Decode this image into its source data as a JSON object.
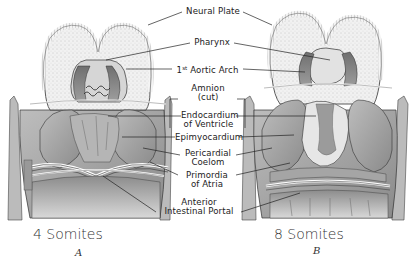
{
  "figure": {
    "labels": {
      "neural_plate": "Neural Plate",
      "pharynx": "Pharynx",
      "aortic_arch_num": "1",
      "aortic_arch_sup": "st",
      "aortic_arch_text": "Aortic Arch",
      "amnion_line1": "Amnion",
      "amnion_line2": "(cut)",
      "endocardium_line1": "Endocardium",
      "endocardium_line2": "of Ventricle",
      "epimyocardium": "Epimyocardium",
      "pericardial_line1": "Pericardial",
      "pericardial_line2": "Coelom",
      "primordia_line1": "Primordia",
      "primordia_line2": "of Atria",
      "portal_line1": "Anterior",
      "portal_line2": "Intestinal Portal"
    },
    "panels": [
      {
        "caption": "4 Somites",
        "letter": "A"
      },
      {
        "caption": "8 Somites",
        "letter": "B"
      }
    ],
    "colors": {
      "ink": "#222222",
      "stipple": "#d9d9d9",
      "tissue_dark": "#7a7a7a",
      "tissue_mid": "#a9a9a9",
      "tissue_light": "#cfcfcf",
      "background": "#ffffff"
    }
  }
}
